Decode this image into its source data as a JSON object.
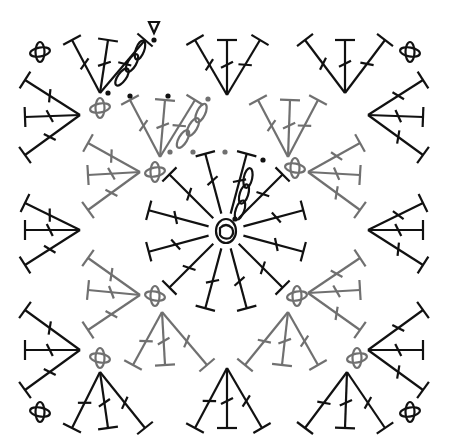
{
  "diagram": {
    "type": "crochet-chart",
    "colors": {
      "round_dark": "#111111",
      "round_gray": "#707070",
      "background": "#ffffff"
    },
    "center_ring": {
      "x": 226,
      "y": 231,
      "stitches": "magic ring with 12 double crochet"
    },
    "legend_symbols": [
      {
        "name": "start-marker",
        "glyph": "▽"
      },
      {
        "name": "join-arrow",
        "glyph": "◀"
      },
      {
        "name": "slip-stitch",
        "glyph": "•"
      },
      {
        "name": "chain",
        "glyph": "oval"
      },
      {
        "name": "double-crochet",
        "glyph": "T with slash"
      }
    ],
    "rounds": [
      {
        "round": 1,
        "color": "dark",
        "description": "12 dc radiating from center ring"
      },
      {
        "round": 2,
        "color": "gray",
        "description": "4 corner fans and 4 side fans of 3 dc"
      },
      {
        "round": 3,
        "color": "dark",
        "description": "outer corner and side clusters of 3 dc"
      }
    ]
  }
}
